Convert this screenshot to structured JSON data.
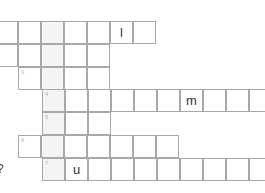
{
  "puzzle": {
    "type": "crossword",
    "cell_size": 23,
    "highlight_column_x": 42,
    "colors": {
      "border": "#a8a8a8",
      "highlight": "#f4f4f4",
      "letter": "#333333",
      "number": "#b5b5b5"
    },
    "rows": [
      {
        "y": 21,
        "start_x": -5,
        "cells": 7,
        "number": "",
        "letters": {
          "5": "l"
        }
      },
      {
        "y": 44,
        "start_x": -5,
        "cells": 5,
        "number": "",
        "letters": {}
      },
      {
        "y": 67,
        "start_x": 18,
        "cells": 4,
        "number": "3",
        "letters": {}
      },
      {
        "y": 89,
        "start_x": 42,
        "cells": 10,
        "number": "4",
        "letters": {
          "6": "m"
        }
      },
      {
        "y": 112,
        "start_x": 42,
        "cells": 3,
        "number": "5",
        "letters": {}
      },
      {
        "y": 135,
        "start_x": 18,
        "cells": 7,
        "number": "6",
        "letters": {}
      },
      {
        "y": 158,
        "start_x": 42,
        "cells": 10,
        "number": "7",
        "letters": {
          "1": "u"
        }
      }
    ]
  },
  "side_mark": "?"
}
